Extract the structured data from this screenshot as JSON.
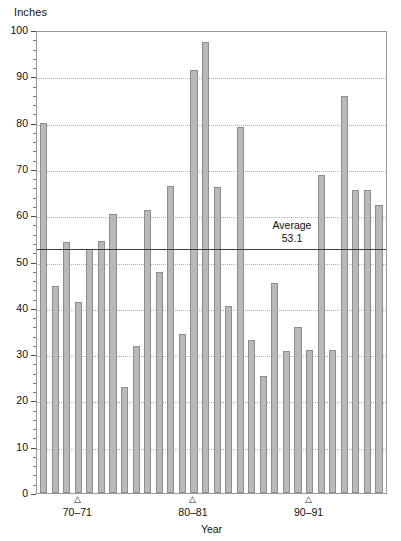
{
  "chart_data": {
    "type": "bar",
    "title": "",
    "subtitle": "",
    "xlabel": "Year",
    "ylabel": "Inches",
    "ylim": [
      0,
      100
    ],
    "ytick_step": 10,
    "yminor_step": 2,
    "grid": true,
    "gridlines_at": [
      10,
      20,
      30,
      40,
      50,
      60,
      70,
      80,
      90
    ],
    "legend": "none",
    "ytick_labels": [
      "0",
      "10",
      "20",
      "30",
      "40",
      "50",
      "60",
      "70",
      "80",
      "90",
      "100"
    ],
    "xtick_labels": [
      "70–71",
      "80–81",
      "90–91"
    ],
    "xtick_marker": "△",
    "xtick_positions": [
      3,
      13,
      23
    ],
    "bar_color": "#b9b9b9",
    "bar_edge_color": "#8e8e8e",
    "average": {
      "label": "Average",
      "value": "53.1",
      "numeric": 53.1,
      "line_color": "#3d3d3d"
    },
    "categories": [
      "1",
      "2",
      "3",
      "4",
      "5",
      "6",
      "7",
      "8",
      "9",
      "10",
      "11",
      "12",
      "13",
      "14",
      "15",
      "16",
      "17",
      "18",
      "19",
      "20",
      "21",
      "22",
      "23",
      "24",
      "25",
      "26",
      "27",
      "28",
      "29",
      "30",
      "31",
      "32",
      "33",
      "34",
      "35"
    ],
    "values": [
      80.0,
      44.8,
      54.3,
      41.2,
      52.8,
      54.5,
      60.2,
      22.9,
      31.8,
      61.2,
      47.7,
      66.4,
      34.3,
      91.4,
      97.5,
      66.0,
      40.3,
      79.0,
      33.0,
      25.2,
      45.4,
      30.6,
      35.8,
      30.9,
      68.7,
      30.9,
      85.8,
      65.4,
      65.4,
      62.3,
      0,
      0,
      0,
      0,
      0
    ],
    "bar_count": 30
  }
}
